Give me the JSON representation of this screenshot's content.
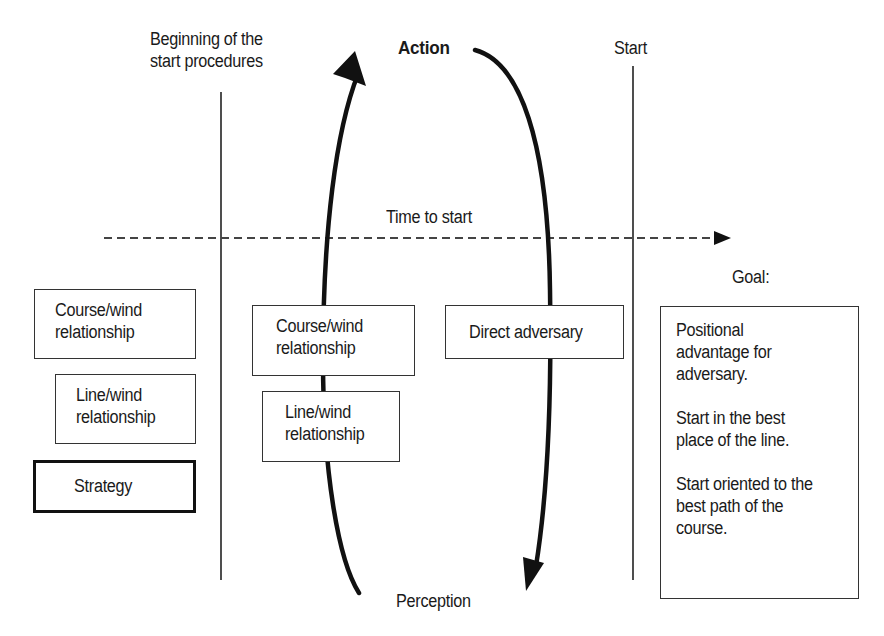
{
  "diagram": {
    "top_labels": {
      "beginning": [
        "Beginning of the",
        "start procedures"
      ],
      "action": "Action",
      "start": "Start",
      "perception": "Perception",
      "time_axis": "Time to start",
      "goal_heading": "Goal:"
    },
    "left_column": [
      {
        "lines": [
          "Course/wind",
          "relationship"
        ],
        "style": "normal"
      },
      {
        "lines": [
          "Line/wind",
          "relationship"
        ],
        "style": "normal"
      },
      {
        "lines": [
          "Strategy"
        ],
        "style": "thick"
      }
    ],
    "center_column": [
      {
        "lines": [
          "Course/wind",
          "relationship"
        ]
      },
      {
        "lines": [
          "Line/wind",
          "relationship"
        ]
      }
    ],
    "right_center_box": {
      "lines": [
        "Direct adversary"
      ]
    },
    "goal_box": {
      "paragraphs": [
        [
          "Positional",
          "advantage for",
          "adversary."
        ],
        [
          "Start in the best",
          "place of the line."
        ],
        [
          "Start oriented to the",
          "best path of the",
          "course."
        ]
      ]
    },
    "colors": {
      "line": "#111111",
      "dashed_axis": "#444444",
      "box_border": "#333333"
    }
  }
}
